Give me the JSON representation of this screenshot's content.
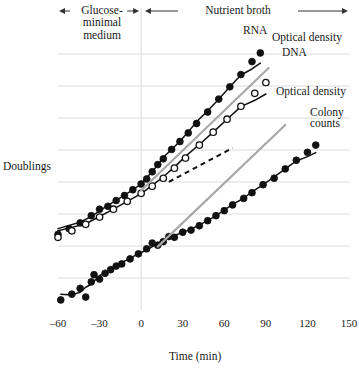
{
  "figure": {
    "width": 359,
    "height": 370,
    "background": "#ffffff"
  },
  "brackets": [
    {
      "id": "glucose",
      "label_line1": "Glucose-",
      "label_line2": "minimal",
      "label_line3": "medium",
      "x_start": -60,
      "x_end": 0
    },
    {
      "id": "nutrient",
      "label_line1": "Nutrient broth",
      "x_start": 0,
      "x_end": 150
    }
  ],
  "annotations": [
    {
      "name": "rna-label",
      "text": "RNA",
      "x": 243,
      "y": 24
    },
    {
      "name": "optical-density-label-1",
      "text": "Optical density",
      "x": 272,
      "y": 31
    },
    {
      "name": "dna-label",
      "text": "DNA",
      "x": 282,
      "y": 46
    },
    {
      "name": "optical-density-label-2",
      "text": "Optical density",
      "x": 276,
      "y": 85
    },
    {
      "name": "colony-counts-label-1",
      "text": "Colony",
      "x": 310,
      "y": 106
    },
    {
      "name": "colony-counts-label-2",
      "text": "counts",
      "x": 310,
      "y": 117
    }
  ],
  "axes": {
    "y_axis_title": "Doublings",
    "x_axis_title": "Time (min)",
    "x_ticks": [
      -60,
      -30,
      0,
      30,
      60,
      90,
      120,
      150
    ],
    "x_tick_labels": [
      "–60",
      "–30",
      "0",
      "30",
      "60",
      "90",
      "120",
      "150"
    ],
    "xlim": [
      -60,
      150
    ],
    "grid": "horizontal",
    "grid_color": "#d9d9d9",
    "axis_color": "#4d4d4d",
    "y_gridline_count": 8
  },
  "colors": {
    "line_black": "#111111",
    "line_gray": "#a8a8a8",
    "marker_fill": "#111111",
    "marker_open_fill": "#ffffff",
    "grid": "#dcdcdc",
    "text": "#1a1a1a"
  },
  "chart_data": {
    "type": "scatter",
    "title": "",
    "subtitle": "",
    "xlabel": "Time (min)",
    "ylabel": "Doublings",
    "xlim": [
      -60,
      150
    ],
    "ylim": [
      0,
      8
    ],
    "grid": true,
    "legend": "inline-annotations",
    "xticks": [
      -60,
      -30,
      0,
      30,
      60,
      90,
      120,
      150
    ],
    "phases": [
      {
        "name": "Glucose-minimal medium",
        "x_range": [
          -60,
          0
        ]
      },
      {
        "name": "Nutrient broth",
        "x_range": [
          0,
          150
        ]
      }
    ],
    "series": [
      {
        "name": "RNA",
        "marker": "filled-circle",
        "line": "solid-black",
        "points": [
          {
            "x": -60,
            "y": 2.1
          },
          {
            "x": -52,
            "y": 2.26
          },
          {
            "x": -44,
            "y": 2.42
          },
          {
            "x": -36,
            "y": 2.62
          },
          {
            "x": -30,
            "y": 2.8
          },
          {
            "x": -24,
            "y": 2.88
          },
          {
            "x": -18,
            "y": 3.04
          },
          {
            "x": -12,
            "y": 3.18
          },
          {
            "x": -6,
            "y": 3.34
          },
          {
            "x": 0,
            "y": 3.5
          },
          {
            "x": 4,
            "y": 3.64
          },
          {
            "x": 8,
            "y": 3.84
          },
          {
            "x": 12,
            "y": 4.04
          },
          {
            "x": 16,
            "y": 4.2
          },
          {
            "x": 22,
            "y": 4.46
          },
          {
            "x": 28,
            "y": 4.68
          },
          {
            "x": 34,
            "y": 4.92
          },
          {
            "x": 40,
            "y": 5.18
          },
          {
            "x": 48,
            "y": 5.5
          },
          {
            "x": 56,
            "y": 5.86
          },
          {
            "x": 64,
            "y": 6.2
          },
          {
            "x": 72,
            "y": 6.54
          },
          {
            "x": 80,
            "y": 6.9
          },
          {
            "x": 86,
            "y": 7.14
          }
        ]
      },
      {
        "name": "DNA",
        "marker": "open-circle",
        "line": "solid-black",
        "points": [
          {
            "x": -60,
            "y": 2.02
          },
          {
            "x": -50,
            "y": 2.2
          },
          {
            "x": -40,
            "y": 2.38
          },
          {
            "x": -30,
            "y": 2.58
          },
          {
            "x": -20,
            "y": 2.8
          },
          {
            "x": -10,
            "y": 3.02
          },
          {
            "x": 0,
            "y": 3.24
          },
          {
            "x": 8,
            "y": 3.44
          },
          {
            "x": 16,
            "y": 3.66
          },
          {
            "x": 24,
            "y": 3.94
          },
          {
            "x": 32,
            "y": 4.22
          },
          {
            "x": 42,
            "y": 4.58
          },
          {
            "x": 52,
            "y": 4.94
          },
          {
            "x": 62,
            "y": 5.3
          },
          {
            "x": 72,
            "y": 5.66
          },
          {
            "x": 82,
            "y": 6.02
          },
          {
            "x": 90,
            "y": 6.32
          }
        ]
      },
      {
        "name": "Optical density (upper)",
        "marker": "none",
        "line": "solid-gray",
        "points": [
          {
            "x": 0,
            "y": 3.32
          },
          {
            "x": 92,
            "y": 6.72
          }
        ]
      },
      {
        "name": "Extrapolated pre-shift rate",
        "marker": "none",
        "line": "dashed-black",
        "points": [
          {
            "x": 20,
            "y": 3.56
          },
          {
            "x": 66,
            "y": 4.5
          }
        ]
      },
      {
        "name": "Colony counts",
        "marker": "filled-circle",
        "line": "solid-black",
        "points": [
          {
            "x": -58,
            "y": 0.28
          },
          {
            "x": -50,
            "y": 0.44
          },
          {
            "x": -44,
            "y": 0.6
          },
          {
            "x": -40,
            "y": 0.36
          },
          {
            "x": -36,
            "y": 0.78
          },
          {
            "x": -34,
            "y": 0.98
          },
          {
            "x": -30,
            "y": 0.86
          },
          {
            "x": -26,
            "y": 1.02
          },
          {
            "x": -22,
            "y": 1.12
          },
          {
            "x": -18,
            "y": 1.22
          },
          {
            "x": -14,
            "y": 1.28
          },
          {
            "x": -8,
            "y": 1.42
          },
          {
            "x": -2,
            "y": 1.56
          },
          {
            "x": 4,
            "y": 1.7
          },
          {
            "x": 8,
            "y": 1.86
          },
          {
            "x": 12,
            "y": 1.8
          },
          {
            "x": 16,
            "y": 1.9
          },
          {
            "x": 20,
            "y": 2.04
          },
          {
            "x": 24,
            "y": 2.02
          },
          {
            "x": 30,
            "y": 2.16
          },
          {
            "x": 36,
            "y": 2.22
          },
          {
            "x": 42,
            "y": 2.34
          },
          {
            "x": 48,
            "y": 2.48
          },
          {
            "x": 54,
            "y": 2.62
          },
          {
            "x": 60,
            "y": 2.76
          },
          {
            "x": 66,
            "y": 2.92
          },
          {
            "x": 74,
            "y": 3.1
          },
          {
            "x": 80,
            "y": 3.26
          },
          {
            "x": 88,
            "y": 3.48
          },
          {
            "x": 96,
            "y": 3.66
          },
          {
            "x": 104,
            "y": 3.92
          },
          {
            "x": 112,
            "y": 4.16
          },
          {
            "x": 120,
            "y": 4.38
          },
          {
            "x": 126,
            "y": 4.58
          }
        ]
      },
      {
        "name": "Optical density (lower)",
        "marker": "none",
        "line": "solid-gray",
        "points": [
          {
            "x": 12,
            "y": 1.76
          },
          {
            "x": 104,
            "y": 5.14
          }
        ]
      }
    ]
  }
}
